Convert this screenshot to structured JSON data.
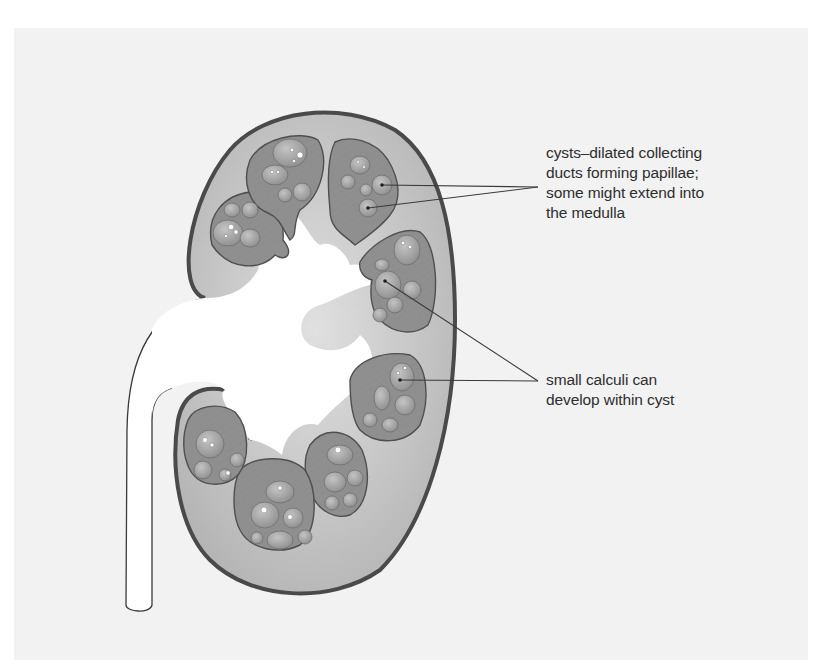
{
  "figure": {
    "background_color": "#f2f2f2",
    "colors": {
      "capsule_outline": "#4a4a4a",
      "cortex_fill": "#c8c8c8",
      "pyramid_fill": "#8f8f8f",
      "cyst_fill": "#a6a6a6",
      "pelvis_fill": "#ffffff",
      "leader_line": "#3a3a3a",
      "text": "#2e2e2e"
    }
  },
  "labels": {
    "cysts": {
      "lines": [
        "cysts–dilated collecting",
        "ducts forming papillae;",
        "some might extend into",
        "the medulla"
      ]
    },
    "calculi": {
      "lines": [
        "small calculi can",
        "develop within cyst"
      ]
    }
  }
}
